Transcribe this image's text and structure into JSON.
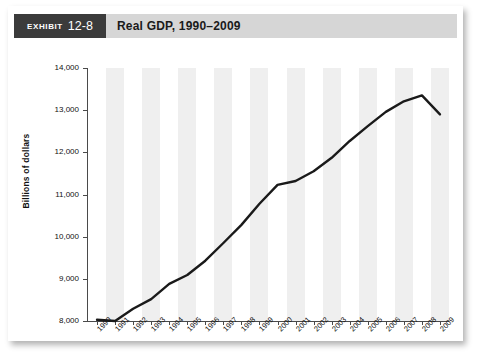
{
  "header": {
    "exhibit_word": "Exhibit",
    "exhibit_number": "12-8",
    "title": "Real GDP, 1990–2009"
  },
  "chart_data": {
    "type": "line",
    "title": "Real GDP, 1990–2009",
    "xlabel": "Year",
    "ylabel": "Billions of dollars",
    "xlim": [
      1990,
      2009
    ],
    "ylim": [
      8000,
      14000
    ],
    "ytick_step": 1000,
    "ytick_labels": [
      "8,000",
      "9,000",
      "10,000",
      "11,000",
      "12,000",
      "13,000",
      "14,000"
    ],
    "ytick_values": [
      8000,
      9000,
      10000,
      11000,
      12000,
      13000,
      14000
    ],
    "grid": false,
    "banding": "alternating vertical gray stripes",
    "legend": "none",
    "line_color": "#1a1a1a",
    "band_color": "#efefef",
    "categories": [
      "1990",
      "1991",
      "1992",
      "1993",
      "1994",
      "1995",
      "1996",
      "1997",
      "1998",
      "1999",
      "2000",
      "2001",
      "2002",
      "2003",
      "2004",
      "2005",
      "2006",
      "2007",
      "2008",
      "2009"
    ],
    "values": [
      8030,
      8000,
      8290,
      8520,
      8880,
      9090,
      9430,
      9850,
      10280,
      10780,
      11230,
      11320,
      11550,
      11870,
      12270,
      12620,
      12960,
      13210,
      13350,
      12900
    ]
  }
}
